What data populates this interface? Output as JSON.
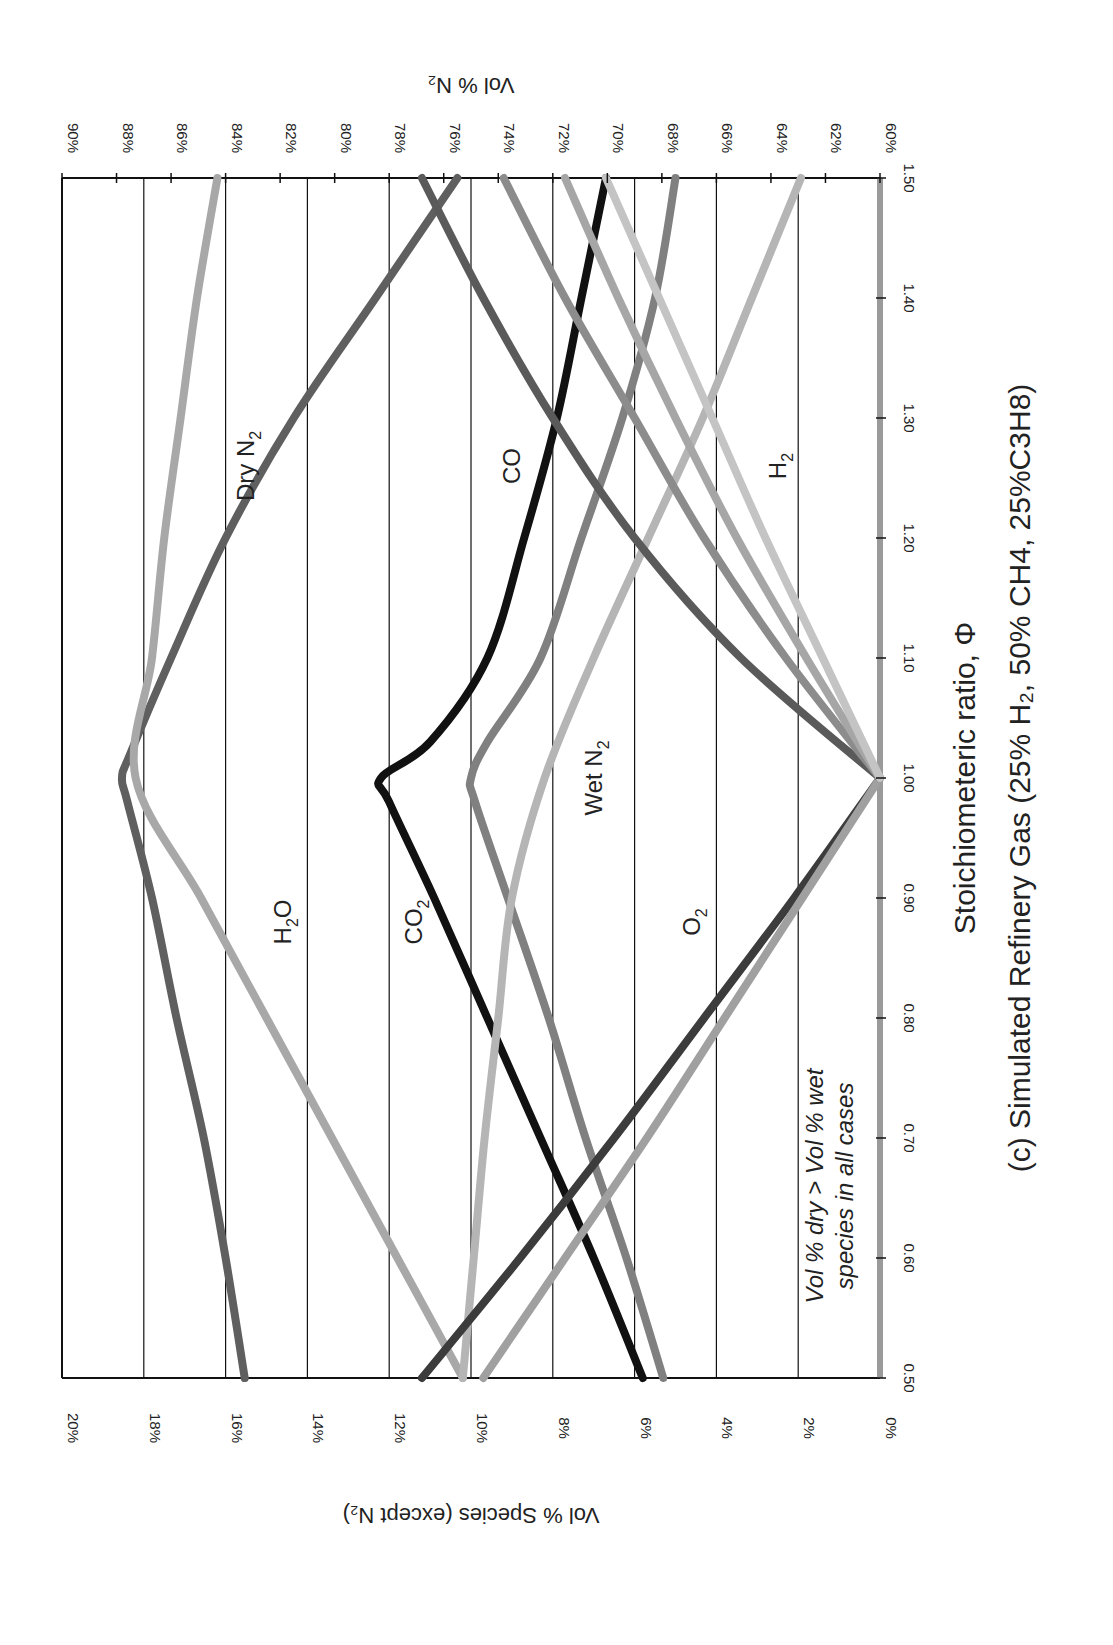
{
  "chart_data": {
    "type": "line",
    "orientation_note": "figure rotated 90° clockwise",
    "xlabel": "Stoichiometeric ratio, Φ",
    "ylabel": "Vol % Species (except N2)",
    "y2label": "Vol % N2",
    "xlim": [
      0.5,
      1.5
    ],
    "ylim": [
      0,
      20
    ],
    "y2lim": [
      60,
      90
    ],
    "x_ticks": [
      "0.50",
      "0.60",
      "0.70",
      "0.80",
      "0.90",
      "1.00",
      "1.10",
      "1.20",
      "1.30",
      "1.40",
      "1.50"
    ],
    "y_ticks": [
      "0%",
      "2%",
      "4%",
      "6%",
      "8%",
      "10%",
      "12%",
      "14%",
      "16%",
      "18%",
      "20%"
    ],
    "y2_ticks": [
      "60%",
      "62%",
      "64%",
      "66%",
      "68%",
      "70%",
      "72%",
      "74%",
      "76%",
      "78%",
      "80%",
      "82%",
      "84%",
      "86%",
      "88%",
      "90%"
    ],
    "grid": true,
    "annotation": "Vol % dry > Vol % wet species in all cases",
    "annotation_lines": [
      "Vol % dry > Vol % wet",
      "species in all cases"
    ],
    "series": [
      {
        "name": "Dry N2",
        "axis": "y2",
        "color": "#5f5f5f",
        "x": [
          0.5,
          0.6,
          0.7,
          0.8,
          0.9,
          0.98,
          1.0,
          1.02,
          1.1,
          1.2,
          1.3,
          1.4,
          1.5
        ],
        "values": [
          83.3,
          84.0,
          84.8,
          85.8,
          86.7,
          87.6,
          87.8,
          87.5,
          86.0,
          84.0,
          81.5,
          78.5,
          75.5
        ]
      },
      {
        "name": "H2O",
        "axis": "y",
        "color": "#a8a8a8",
        "x": [
          0.5,
          0.6,
          0.7,
          0.8,
          0.9,
          1.0,
          1.1,
          1.2,
          1.3,
          1.4,
          1.5
        ],
        "values": [
          10.2,
          11.8,
          13.4,
          15.0,
          16.6,
          18.2,
          17.8,
          17.5,
          17.1,
          16.7,
          16.2
        ]
      },
      {
        "name": "CO2 (dry)",
        "axis": "y",
        "color": "#111111",
        "x": [
          0.5,
          0.6,
          0.7,
          0.8,
          0.9,
          0.98,
          1.0,
          1.03,
          1.1,
          1.2,
          1.3,
          1.4,
          1.5
        ],
        "values": [
          5.8,
          7.0,
          8.3,
          9.6,
          10.9,
          12.0,
          12.2,
          11.0,
          9.6,
          8.7,
          7.9,
          7.3,
          6.7
        ]
      },
      {
        "name": "CO2 (wet)",
        "axis": "y",
        "color": "#808080",
        "x": [
          0.5,
          0.6,
          0.7,
          0.8,
          0.9,
          0.98,
          1.0,
          1.03,
          1.1,
          1.2,
          1.3,
          1.4,
          1.5
        ],
        "values": [
          5.3,
          6.2,
          7.2,
          8.1,
          9.1,
          9.9,
          10.0,
          9.6,
          8.3,
          7.3,
          6.3,
          5.5,
          5.0
        ]
      },
      {
        "name": "Wet N2",
        "axis": "y2",
        "color": "#b5b5b5",
        "x": [
          0.5,
          0.6,
          0.7,
          0.8,
          0.9,
          1.0,
          1.1,
          1.2,
          1.3,
          1.4,
          1.5
        ],
        "values": [
          75.3,
          74.9,
          74.5,
          74.0,
          73.5,
          72.3,
          70.5,
          68.5,
          66.5,
          64.7,
          62.9
        ]
      },
      {
        "name": "O2 (dry)",
        "axis": "y",
        "color": "#3c3c3c",
        "x": [
          0.5,
          0.6,
          0.7,
          0.8,
          0.9,
          1.0
        ],
        "values": [
          11.2,
          8.8,
          6.5,
          4.3,
          2.1,
          0.0
        ]
      },
      {
        "name": "O2 (wet)",
        "axis": "y",
        "color": "#a0a0a0",
        "x": [
          0.5,
          0.6,
          0.7,
          0.8,
          0.9,
          1.0
        ],
        "values": [
          9.7,
          7.7,
          5.7,
          3.8,
          1.9,
          0.0
        ]
      },
      {
        "name": "CO (dry)",
        "axis": "y",
        "color": "#5a5a5a",
        "x": [
          1.0,
          1.1,
          1.2,
          1.3,
          1.4,
          1.5
        ],
        "values": [
          0.0,
          3.4,
          6.0,
          8.0,
          9.7,
          11.2
        ]
      },
      {
        "name": "CO (wet)",
        "axis": "y",
        "color": "#8c8c8c",
        "x": [
          1.0,
          1.1,
          1.2,
          1.3,
          1.4,
          1.5
        ],
        "values": [
          0.0,
          2.3,
          4.3,
          6.0,
          7.7,
          9.2
        ]
      },
      {
        "name": "H2 (dry)",
        "axis": "y",
        "color": "#a6a6a6",
        "x": [
          1.0,
          1.1,
          1.2,
          1.3,
          1.4,
          1.5
        ],
        "values": [
          0.0,
          1.8,
          3.5,
          5.0,
          6.4,
          7.7
        ]
      },
      {
        "name": "H2 (wet)",
        "axis": "y",
        "color": "#c4c4c4",
        "x": [
          1.0,
          1.1,
          1.2,
          1.3,
          1.4,
          1.5
        ],
        "values": [
          0.0,
          1.4,
          2.8,
          4.1,
          5.4,
          6.7
        ]
      }
    ],
    "labels": [
      {
        "text": "Dry N",
        "sub": "2",
        "phi": 1.26,
        "pct": 15.3
      },
      {
        "text": "CO",
        "sub": "",
        "phi": 1.26,
        "pct": 8.8
      },
      {
        "text": "H",
        "sub": "2",
        "phi": 1.26,
        "pct": 2.3
      },
      {
        "text": "H",
        "sub": "2",
        "end": "O",
        "phi": 0.88,
        "pct": 14.4
      },
      {
        "text": "CO",
        "sub": "2",
        "phi": 0.88,
        "pct": 11.2
      },
      {
        "text": "O",
        "sub": "2",
        "phi": 0.88,
        "pct": 4.4
      },
      {
        "text": "Wet N",
        "sub": "2",
        "phi": 1.0,
        "pct": 6.8
      }
    ]
  }
}
